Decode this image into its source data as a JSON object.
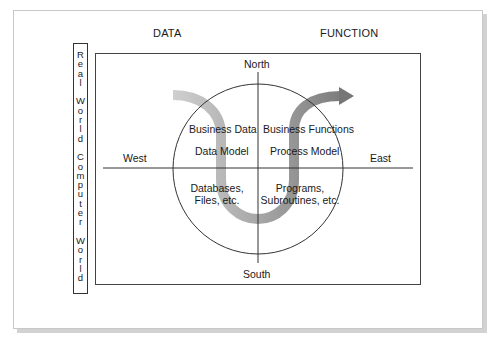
{
  "headers": {
    "left": "DATA",
    "right": "FUNCTION"
  },
  "side_label": {
    "lines": [
      "Real",
      "World",
      "Computer",
      "World"
    ]
  },
  "compass": {
    "north": "North",
    "south": "South",
    "west": "West",
    "east": "East"
  },
  "quadrants": {
    "upper_left": {
      "line1": "Business Data",
      "line2": "Data Model"
    },
    "upper_right": {
      "line1": "Business Functions",
      "line2": "Process Model"
    },
    "lower_left": {
      "line1": "Databases,",
      "line2": "Files, etc."
    },
    "lower_right": {
      "line1": "Programs,",
      "line2": "Subroutines, etc."
    }
  },
  "arrow": {
    "description": "U-shaped flow arrow from upper-left (Data) down through Computer World and back up to upper-right (Function)",
    "color_start": "#c8c8c8",
    "color_end": "#7a7a7a"
  },
  "colors": {
    "line": "#333333",
    "page_border": "#c8c8c8",
    "shadow": "#d2d2d2"
  }
}
